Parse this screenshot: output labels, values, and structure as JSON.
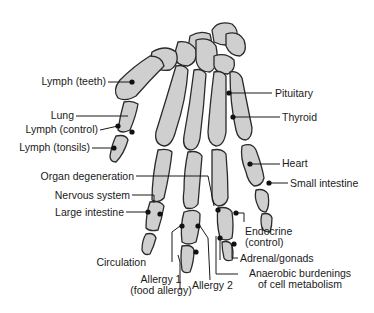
{
  "diagram": {
    "colors": {
      "bone_fill": "#cfcfcf",
      "bone_stroke": "#2a2a2a",
      "line": "#1a1a1a",
      "point": "#111111",
      "background": "#ffffff"
    },
    "labels": {
      "lymph_teeth": "Lymph (teeth)",
      "lung": "Lung",
      "lymph_control": "Lymph (control)",
      "lymph_tonsils": "Lymph (tonsils)",
      "pituitary": "Pituitary",
      "thyroid": "Thyroid",
      "heart": "Heart",
      "small_intestine": "Small intestine",
      "organ_degeneration": "Organ degeneration",
      "nervous_system": "Nervous system",
      "large_intestine": "Large intestine",
      "endocrine_1": "Endocrine",
      "endocrine_2": "(control)",
      "adrenal_gonads": "Adrenal/gonads",
      "circulation": "Circulation",
      "allergy1_1": "Allergy 1",
      "allergy1_2": "(food allergy)",
      "allergy2": "Allergy 2",
      "anaerobic_1": "Anaerobic burdenings",
      "anaerobic_2": "of cell metabolism"
    }
  }
}
